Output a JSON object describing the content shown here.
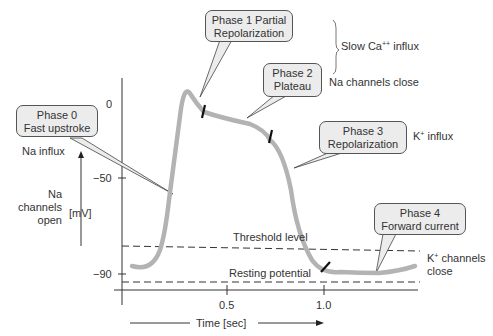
{
  "diagram": {
    "y_axis": {
      "unit_label": "[mV]",
      "ticks": [
        "0",
        "−50",
        "−90"
      ]
    },
    "x_axis": {
      "label": "Time [sec]",
      "ticks": [
        "0.5",
        "1.0"
      ]
    },
    "callouts": [
      {
        "line1": "Phase 0",
        "line2": "Fast upstroke"
      },
      {
        "line1": "Phase 1 Partial",
        "line2": "Repolarization"
      },
      {
        "line1": "Phase 2",
        "line2": "Plateau"
      },
      {
        "line1": "Phase 3",
        "line2": "Repolarization"
      },
      {
        "line1": "Phase 4",
        "line2": "Forward current"
      }
    ],
    "annotations": {
      "na_influx": "Na influx",
      "na_channels_open_1": "Na",
      "na_channels_open_2": "channels",
      "na_channels_open_3": "open",
      "slow_ca_influx_pre": "Slow Ca",
      "slow_ca_influx_sup": "++",
      "slow_ca_influx_post": " influx",
      "na_channels_close": "Na channels close",
      "k_influx_pre": "K",
      "k_influx_sup": "+",
      "k_influx_post": " influx",
      "k_channels_close_pre": "K",
      "k_channels_close_sup": "+",
      "k_channels_close_post": " channels",
      "k_channels_close_2": "close",
      "threshold_level": "Threshold level",
      "resting_potential": "Resting potential"
    },
    "colors": {
      "curve": "#b3b3b3",
      "callout_fill": "#ececec",
      "axis": "#333333"
    }
  }
}
